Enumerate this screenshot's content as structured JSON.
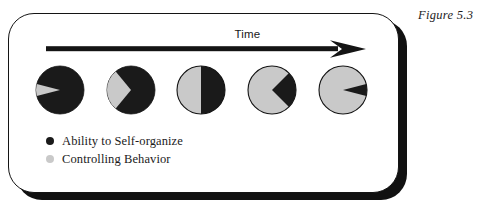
{
  "figure": {
    "caption": "Figure 5.3"
  },
  "panel": {
    "axis": {
      "label": "Time",
      "direction": "left-to-right",
      "arrow_icon": "right-arrow-icon"
    }
  },
  "legend": {
    "items": [
      {
        "label": "Ability to Self-organize",
        "color": "#1a1a1a",
        "swatch_icon": "filled-circle-icon"
      },
      {
        "label": "Controlling Behavior",
        "color": "#c9c9c9",
        "swatch_icon": "filled-circle-icon"
      }
    ]
  },
  "colors": {
    "self_organize": "#1a1a1a",
    "controlling": "#c9c9c9",
    "outline": "#141414",
    "panel_shadow": "#111111",
    "background": "#ffffff"
  },
  "chart_data": {
    "type": "pie",
    "title": "",
    "subtitle": "",
    "xlabel": "Time",
    "ylabel": "",
    "legend_position": "bottom-left",
    "grid": false,
    "series": [
      {
        "name": "Ability to Self-organize",
        "color": "#1a1a1a",
        "values": [
          92,
          72,
          50,
          25,
          8
        ]
      },
      {
        "name": "Controlling Behavior",
        "color": "#c9c9c9",
        "values": [
          8,
          28,
          50,
          75,
          92
        ]
      }
    ],
    "categories": [
      "Stage 1",
      "Stage 2",
      "Stage 3",
      "Stage 4",
      "Stage 5"
    ],
    "annotations": [
      "Time"
    ],
    "charts": [
      {
        "index": 1,
        "self_organize": 92,
        "controlling": 8,
        "cx": 60,
        "cy": 90,
        "r": 24
      },
      {
        "index": 2,
        "self_organize": 72,
        "controlling": 28,
        "cx": 131,
        "cy": 90,
        "r": 24
      },
      {
        "index": 3,
        "self_organize": 50,
        "controlling": 50,
        "cx": 201,
        "cy": 90,
        "r": 24
      },
      {
        "index": 4,
        "self_organize": 25,
        "controlling": 75,
        "cx": 272,
        "cy": 90,
        "r": 24
      },
      {
        "index": 5,
        "self_organize": 8,
        "controlling": 92,
        "cx": 343,
        "cy": 90,
        "r": 24
      }
    ]
  }
}
